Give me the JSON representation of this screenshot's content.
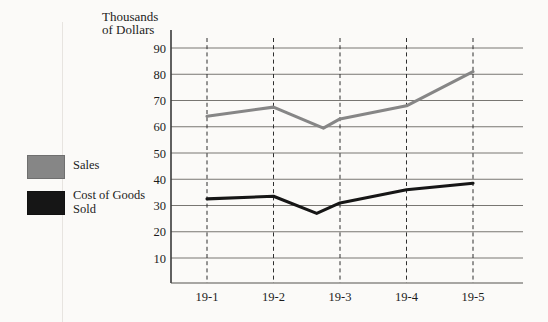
{
  "figure": {
    "background": "#fbfaf8",
    "text_color": "#1c1c1c"
  },
  "chart_data": {
    "type": "line",
    "title": "",
    "ylabel": "Thousands of Dollars",
    "ylabel_lines": [
      "Thousands",
      "of Dollars"
    ],
    "xlabel": "",
    "categories": [
      "19-1",
      "19-2",
      "19-3",
      "19-4",
      "19-5"
    ],
    "yticks": [
      90,
      80,
      70,
      60,
      50,
      40,
      30,
      20,
      10
    ],
    "ylim": [
      0,
      95
    ],
    "grid": {
      "horizontal": "solid",
      "vertical": "dashed at each category"
    },
    "legend_position": "left-middle",
    "series": [
      {
        "name": "Sales",
        "color": "#868686",
        "x": [
          1,
          2,
          2.75,
          3,
          4,
          5
        ],
        "values": [
          64,
          67.5,
          59.5,
          63,
          68,
          81
        ]
      },
      {
        "name": "Cost of Goods Sold",
        "color": "#161616",
        "x": [
          1,
          2,
          2.65,
          3,
          4,
          5
        ],
        "values": [
          32.5,
          33.5,
          27,
          31,
          36,
          38.5
        ]
      }
    ]
  }
}
